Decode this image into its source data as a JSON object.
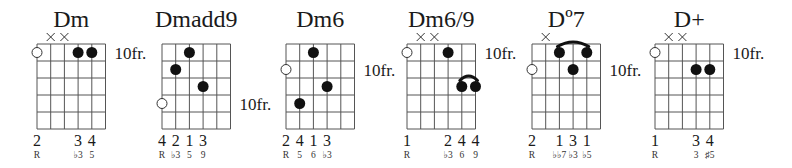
{
  "style": {
    "ink": "#111111",
    "grid": "#555555",
    "background": "#ffffff"
  },
  "chords": [
    {
      "name": "Dm",
      "fret_label": "10fr.",
      "fret_label_row": 0,
      "muted_strings": [
        1,
        2
      ],
      "open_markers": [
        {
          "string": 0,
          "row": 0
        }
      ],
      "dots": [
        {
          "string": 3,
          "row": 0
        },
        {
          "string": 4,
          "row": 0
        }
      ],
      "barres": [],
      "fingers": [
        {
          "string": 0,
          "label": "2"
        },
        {
          "string": 3,
          "label": "3"
        },
        {
          "string": 4,
          "label": "4"
        }
      ],
      "intervals": [
        {
          "string": 0,
          "label": "R"
        },
        {
          "string": 3,
          "label": "♭3"
        },
        {
          "string": 4,
          "label": "5"
        }
      ]
    },
    {
      "name": "Dmadd9",
      "fret_label": "10fr.",
      "fret_label_row": 3,
      "muted_strings": [],
      "open_markers": [
        {
          "string": 0,
          "row": 3
        }
      ],
      "dots": [
        {
          "string": 2,
          "row": 0
        },
        {
          "string": 1,
          "row": 1
        },
        {
          "string": 3,
          "row": 2
        }
      ],
      "barres": [],
      "fingers": [
        {
          "string": 0,
          "label": "4"
        },
        {
          "string": 1,
          "label": "2"
        },
        {
          "string": 2,
          "label": "1"
        },
        {
          "string": 3,
          "label": "3"
        }
      ],
      "intervals": [
        {
          "string": 0,
          "label": "R"
        },
        {
          "string": 1,
          "label": "♭3"
        },
        {
          "string": 2,
          "label": "5"
        },
        {
          "string": 3,
          "label": "9"
        }
      ]
    },
    {
      "name": "Dm6",
      "fret_label": "10fr.",
      "fret_label_row": 1,
      "muted_strings": [],
      "open_markers": [
        {
          "string": 0,
          "row": 1
        }
      ],
      "dots": [
        {
          "string": 2,
          "row": 0
        },
        {
          "string": 3,
          "row": 2
        },
        {
          "string": 1,
          "row": 3
        }
      ],
      "barres": [],
      "fingers": [
        {
          "string": 0,
          "label": "2"
        },
        {
          "string": 1,
          "label": "4"
        },
        {
          "string": 2,
          "label": "1"
        },
        {
          "string": 3,
          "label": "3"
        }
      ],
      "intervals": [
        {
          "string": 0,
          "label": "R"
        },
        {
          "string": 1,
          "label": "5"
        },
        {
          "string": 2,
          "label": "6"
        },
        {
          "string": 3,
          "label": "♭3"
        }
      ]
    },
    {
      "name": "Dm6/9",
      "fret_label": "10fr.",
      "fret_label_row": 0,
      "muted_strings": [
        1,
        2
      ],
      "open_markers": [
        {
          "string": 0,
          "row": 0
        }
      ],
      "dots": [
        {
          "string": 3,
          "row": 0
        },
        {
          "string": 4,
          "row": 2
        },
        {
          "string": 5,
          "row": 2
        }
      ],
      "barres": [
        {
          "from": 4,
          "to": 5,
          "row": 2
        }
      ],
      "fingers": [
        {
          "string": 0,
          "label": "1"
        },
        {
          "string": 3,
          "label": "2"
        },
        {
          "string": 4,
          "label": "4"
        },
        {
          "string": 5,
          "label": "4"
        }
      ],
      "intervals": [
        {
          "string": 0,
          "label": "R"
        },
        {
          "string": 3,
          "label": "♭3"
        },
        {
          "string": 4,
          "label": "6"
        },
        {
          "string": 5,
          "label": "9"
        }
      ]
    },
    {
      "name": "Dº7",
      "fret_label": "10fr.",
      "fret_label_row": 1,
      "muted_strings": [
        1
      ],
      "open_markers": [
        {
          "string": 0,
          "row": 1
        }
      ],
      "dots": [
        {
          "string": 2,
          "row": 0
        },
        {
          "string": 4,
          "row": 0
        },
        {
          "string": 3,
          "row": 1
        }
      ],
      "barres": [
        {
          "from": 2,
          "to": 4,
          "row": 0
        }
      ],
      "fingers": [
        {
          "string": 0,
          "label": "2"
        },
        {
          "string": 2,
          "label": "1"
        },
        {
          "string": 3,
          "label": "3"
        },
        {
          "string": 4,
          "label": "1"
        }
      ],
      "intervals": [
        {
          "string": 0,
          "label": "R"
        },
        {
          "string": 2,
          "label": "♭♭7"
        },
        {
          "string": 3,
          "label": "♭3"
        },
        {
          "string": 4,
          "label": "♭5"
        }
      ]
    },
    {
      "name": "D+",
      "fret_label": "10fr.",
      "fret_label_row": 0,
      "muted_strings": [
        1,
        2
      ],
      "open_markers": [
        {
          "string": 0,
          "row": 0
        }
      ],
      "dots": [
        {
          "string": 3,
          "row": 1
        },
        {
          "string": 4,
          "row": 1
        }
      ],
      "barres": [],
      "fingers": [
        {
          "string": 0,
          "label": "1"
        },
        {
          "string": 3,
          "label": "3"
        },
        {
          "string": 4,
          "label": "4"
        }
      ],
      "intervals": [
        {
          "string": 0,
          "label": "R"
        },
        {
          "string": 3,
          "label": "3"
        },
        {
          "string": 4,
          "label": "♯5"
        }
      ]
    }
  ],
  "layout": {
    "grid_lefts": [
      37,
      162,
      286,
      407,
      532,
      655
    ],
    "grid_top": 44,
    "string_spacing": 13.7,
    "fret_spacing": 17,
    "num_strings": 6,
    "num_frets": 5
  }
}
